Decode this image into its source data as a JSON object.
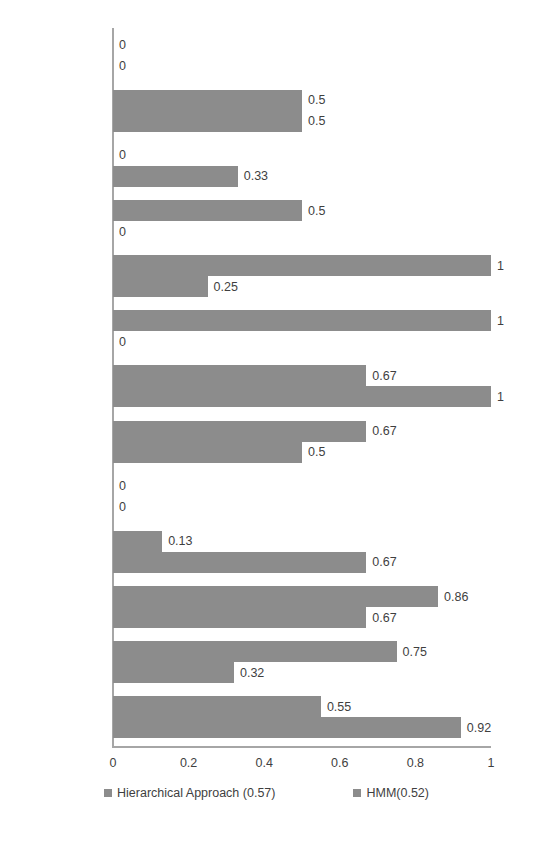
{
  "chart_data": {
    "type": "bar",
    "orientation": "horizontal",
    "title": "",
    "xlabel": "",
    "ylabel": "",
    "xlim": [
      0,
      1
    ],
    "xticks": [
      "0",
      "0.2",
      "0.4",
      "0.6",
      "0.8",
      "1"
    ],
    "grid": false,
    "legend_position": "bottom",
    "bar_color": "#8c8c8c",
    "axis_color": "#a6a6a6",
    "text_color": "#3f3f3f",
    "categories": [
      "Printing\nPaperwork",
      "Driving",
      "Talking to\nsomeone",
      "Meeting",
      "Having Class",
      "Presentaion",
      "Video Gaming",
      "Cycling",
      "Washing\nDishes",
      "Eating",
      "Cooking",
      "Working on\nComputer",
      "Walking"
    ],
    "series": [
      {
        "name": "Hierarchical Approach (0.57)",
        "values": [
          0,
          0.5,
          0,
          0.5,
          1,
          1,
          0.67,
          0.67,
          0,
          0.13,
          0.86,
          0.75,
          0.55
        ],
        "labels": [
          "0",
          "0.5",
          "0",
          "0.5",
          "1",
          "1",
          "0.67",
          "0.67",
          "0",
          "0.13",
          "0.86",
          "0.75",
          "0.55"
        ]
      },
      {
        "name": "HMM(0.52)",
        "values": [
          0,
          0.5,
          0.33,
          0,
          0.25,
          0,
          1,
          0.5,
          0,
          0.67,
          0.67,
          0.32,
          0.92
        ],
        "labels": [
          "0",
          "0.5",
          "0.33",
          "0",
          "0.25",
          "0",
          "1",
          "0.5",
          "0",
          "0.67",
          "0.67",
          "0.32",
          "0.92"
        ]
      }
    ]
  },
  "legend": {
    "items": [
      {
        "label": "Hierarchical Approach (0.57)",
        "color": "#8c8c8c"
      },
      {
        "label": "HMM(0.52)",
        "color": "#8c8c8c"
      }
    ]
  }
}
